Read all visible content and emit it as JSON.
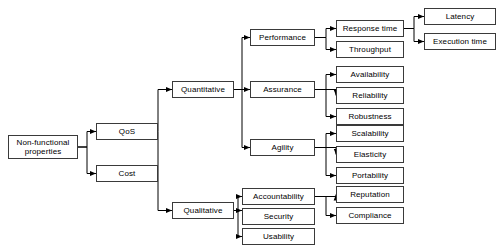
{
  "diagram": {
    "type": "tree",
    "colors": {
      "node_border": "#3a3a3a",
      "node_fill": "#ffffff",
      "edge": "#000000",
      "text": "#000000"
    },
    "nodes": [
      {
        "id": "root",
        "label": "Non-functional\nproperties",
        "x": 8,
        "y": 135,
        "w": 70,
        "h": 24
      },
      {
        "id": "qos",
        "label": "QoS",
        "x": 96,
        "y": 123,
        "w": 62,
        "h": 17
      },
      {
        "id": "cost",
        "label": "Cost",
        "x": 96,
        "y": 165,
        "w": 62,
        "h": 17
      },
      {
        "id": "quantitative",
        "label": "Quantitative",
        "x": 172,
        "y": 81,
        "w": 62,
        "h": 17
      },
      {
        "id": "qualitative",
        "label": "Qualitative",
        "x": 172,
        "y": 202,
        "w": 62,
        "h": 17
      },
      {
        "id": "performance",
        "label": "Performance",
        "x": 250,
        "y": 29,
        "w": 65,
        "h": 17
      },
      {
        "id": "assurance",
        "label": "Assurance",
        "x": 250,
        "y": 81,
        "w": 65,
        "h": 17
      },
      {
        "id": "agility",
        "label": "Agility",
        "x": 250,
        "y": 139,
        "w": 65,
        "h": 17
      },
      {
        "id": "accountability",
        "label": "Accountability",
        "x": 242,
        "y": 188,
        "w": 73,
        "h": 17
      },
      {
        "id": "security",
        "label": "Security",
        "x": 242,
        "y": 208,
        "w": 73,
        "h": 17
      },
      {
        "id": "usability",
        "label": "Usability",
        "x": 242,
        "y": 228,
        "w": 73,
        "h": 17
      },
      {
        "id": "response_time",
        "label": "Response time",
        "x": 336,
        "y": 20,
        "w": 68,
        "h": 17
      },
      {
        "id": "throughput",
        "label": "Throughput",
        "x": 336,
        "y": 41,
        "w": 68,
        "h": 17
      },
      {
        "id": "availability",
        "label": "Availability",
        "x": 336,
        "y": 66,
        "w": 68,
        "h": 17
      },
      {
        "id": "reliability",
        "label": "Reliability",
        "x": 336,
        "y": 87,
        "w": 68,
        "h": 17
      },
      {
        "id": "robustness",
        "label": "Robustness",
        "x": 336,
        "y": 108,
        "w": 68,
        "h": 17
      },
      {
        "id": "scalability",
        "label": "Scalability",
        "x": 336,
        "y": 125,
        "w": 68,
        "h": 17
      },
      {
        "id": "elasticity",
        "label": "Elasticity",
        "x": 336,
        "y": 146,
        "w": 68,
        "h": 17
      },
      {
        "id": "portability",
        "label": "Portability",
        "x": 336,
        "y": 167,
        "w": 68,
        "h": 17
      },
      {
        "id": "reputation",
        "label": "Reputation",
        "x": 336,
        "y": 186,
        "w": 68,
        "h": 17
      },
      {
        "id": "compliance",
        "label": "Compliance",
        "x": 336,
        "y": 207,
        "w": 68,
        "h": 17
      },
      {
        "id": "latency",
        "label": "Latency",
        "x": 424,
        "y": 8,
        "w": 72,
        "h": 17
      },
      {
        "id": "execution_time",
        "label": "Execution time",
        "x": 424,
        "y": 33,
        "w": 72,
        "h": 17
      }
    ],
    "edges": [
      {
        "from": "root",
        "to": "qos",
        "d": "M 78,147 L 87,147 L 87,131.5 L 96,131.5"
      },
      {
        "from": "root",
        "to": "cost",
        "d": "M 78,147 L 87,147 L 87,173.5 L 96,173.5"
      },
      {
        "from": "qos",
        "to": "quantitative",
        "d": "M 158,131.5 L 158,89.5 L 172,89.5"
      },
      {
        "from": "qos",
        "to": "qualitative",
        "d": "M 158,131.5 L 158,210.5 L 172,210.5"
      },
      {
        "from": "quantitative",
        "to": "performance",
        "d": "M 234,89.5 L 242,89.5 L 242,37.5 L 250,37.5"
      },
      {
        "from": "quantitative",
        "to": "assurance",
        "d": "M 234,89.5 L 250,89.5"
      },
      {
        "from": "quantitative",
        "to": "agility",
        "d": "M 234,89.5 L 242,89.5 L 242,147.5 L 250,147.5"
      },
      {
        "from": "qualitative",
        "to": "accountability",
        "d": "M 234,210.5 L 238,210.5 L 238,196.5 L 242,196.5"
      },
      {
        "from": "qualitative",
        "to": "security",
        "d": "M 234,210.5 L 242,210.5"
      },
      {
        "from": "qualitative",
        "to": "usability",
        "d": "M 234,210.5 L 238,210.5 L 238,236.5 L 242,236.5"
      },
      {
        "from": "performance",
        "to": "response_time",
        "d": "M 315,37.5 L 326,37.5 L 326,28.5 L 336,28.5"
      },
      {
        "from": "performance",
        "to": "throughput",
        "d": "M 315,37.5 L 326,37.5 L 326,49.5 L 336,49.5"
      },
      {
        "from": "assurance",
        "to": "availability",
        "d": "M 315,89.5 L 326,89.5 L 326,74.5 L 336,74.5"
      },
      {
        "from": "assurance",
        "to": "reliability",
        "d": "M 315,89.5 L 336,89.5 L 336,95.5"
      },
      {
        "from": "assurance",
        "to": "robustness",
        "d": "M 315,89.5 L 326,89.5 L 326,116.5 L 336,116.5"
      },
      {
        "from": "agility",
        "to": "scalability",
        "d": "M 315,147.5 L 326,147.5 L 326,133.5 L 336,133.5"
      },
      {
        "from": "agility",
        "to": "elasticity",
        "d": "M 315,147.5 L 336,147.5 L 336,154.5"
      },
      {
        "from": "agility",
        "to": "portability",
        "d": "M 315,147.5 L 326,147.5 L 326,175.5 L 336,175.5"
      },
      {
        "from": "accountability",
        "to": "reputation",
        "d": "M 315,196.5 L 336,196.5 L 336,194.5"
      },
      {
        "from": "accountability",
        "to": "compliance",
        "d": "M 315,196.5 L 326,196.5 L 326,215.5 L 336,215.5"
      },
      {
        "from": "response_time",
        "to": "latency",
        "d": "M 404,28.5 L 414,28.5 L 414,16.5 L 424,16.5"
      },
      {
        "from": "response_time",
        "to": "execution_time",
        "d": "M 404,28.5 L 414,28.5 L 414,41.5 L 424,41.5"
      }
    ]
  }
}
